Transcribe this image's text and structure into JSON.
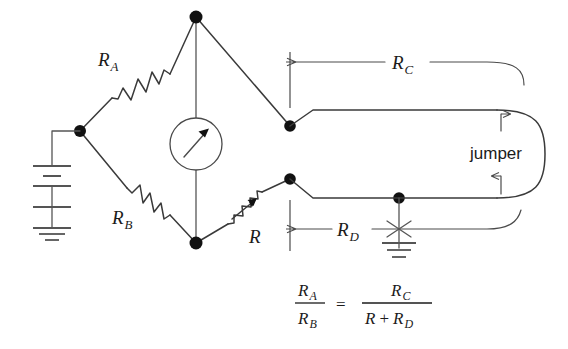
{
  "diagram": {
    "type": "circuit-schematic",
    "width": 568,
    "height": 349,
    "background_color": "#ffffff",
    "wire_color": "#3a3a3a",
    "node_color": "#111111",
    "text_color": "#1b1b1b"
  },
  "labels": {
    "r_a": {
      "base": "R",
      "sub": "A"
    },
    "r_b": {
      "base": "R",
      "sub": "B"
    },
    "r_c": {
      "base": "R",
      "sub": "C"
    },
    "r_d": {
      "base": "R",
      "sub": "D"
    },
    "r_var": {
      "base": "R",
      "sub": ""
    },
    "jumper": "jumper"
  },
  "components": {
    "galvanometer": {
      "name": "galvanometer",
      "symbol": "meter-with-needle"
    },
    "battery": {
      "name": "battery",
      "symbol": "multi-cell-battery"
    },
    "ground_battery": {
      "name": "ground",
      "symbol": "earth-ground"
    },
    "ground_rd": {
      "name": "ground",
      "symbol": "earth-ground"
    },
    "resistor_a": {
      "name": "fixed-resistor",
      "symbol": "zigzag"
    },
    "resistor_b": {
      "name": "fixed-resistor",
      "symbol": "zigzag"
    },
    "resistor_var": {
      "name": "variable-resistor",
      "symbol": "zigzag-with-arrow"
    }
  },
  "equation": {
    "lhs": {
      "num_base": "R",
      "num_sub": "A",
      "den_base": "R",
      "den_sub": "B"
    },
    "equals": "=",
    "rhs": {
      "num_base": "R",
      "num_sub": "C",
      "den_term1": "R",
      "den_plus": "+",
      "den_term2_base": "R",
      "den_term2_sub": "D"
    }
  }
}
